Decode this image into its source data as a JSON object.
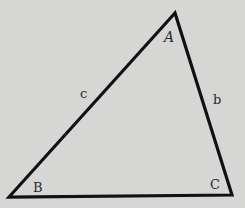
{
  "diagram": {
    "type": "triangle",
    "background_color": "#d8d8d6",
    "line_color": "#111111",
    "vertices": [
      {
        "name": "A",
        "x": 175,
        "y": 13,
        "label": "A",
        "label_x": 164,
        "label_y": 42,
        "italic": true
      },
      {
        "name": "B",
        "x": 9,
        "y": 197,
        "label": "B",
        "label_x": 33,
        "label_y": 192,
        "italic": false
      },
      {
        "name": "C",
        "x": 232,
        "y": 195,
        "label": "C",
        "label_x": 210,
        "label_y": 189,
        "italic": false
      }
    ],
    "sides": [
      {
        "name": "c",
        "label": "c",
        "from": "B",
        "to": "A",
        "label_x": 80,
        "label_y": 98
      },
      {
        "name": "b",
        "label": "b",
        "from": "A",
        "to": "C",
        "label_x": 213,
        "label_y": 104
      },
      {
        "name": "a",
        "label": "",
        "from": "B",
        "to": "C"
      }
    ]
  }
}
